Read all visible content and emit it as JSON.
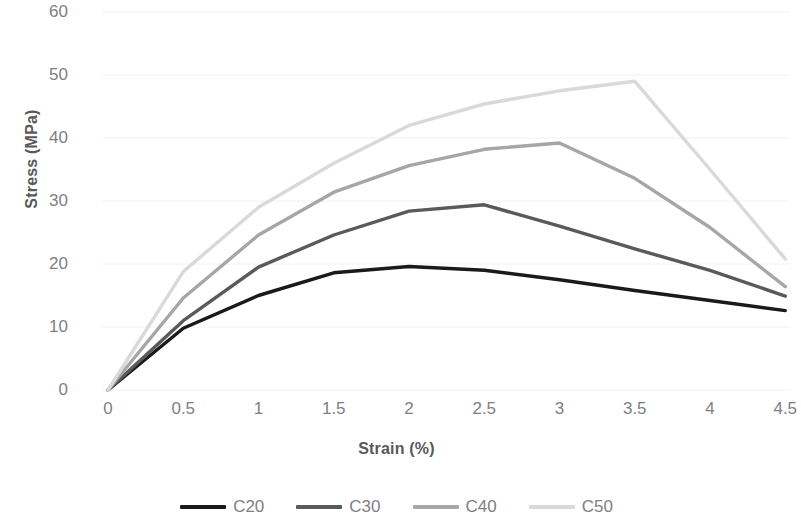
{
  "chart_data": {
    "type": "line",
    "title": "",
    "xlabel": "Strain (%)",
    "ylabel": "Stress (MPa)",
    "xlim": [
      0,
      4.75
    ],
    "ylim": [
      0,
      60
    ],
    "grid": true,
    "legend_position": "bottom",
    "x_ticks": [
      "0",
      "0.5",
      "1",
      "1.5",
      "2",
      "2.5",
      "3",
      "3.5",
      "4",
      "4.5"
    ],
    "x_tick_values": [
      0,
      0.5,
      1,
      1.5,
      2,
      2.5,
      3,
      3.5,
      4,
      4.5
    ],
    "y_ticks": [
      "0",
      "10",
      "20",
      "30",
      "40",
      "50",
      "60"
    ],
    "y_tick_values": [
      0,
      10,
      20,
      30,
      40,
      50,
      60
    ],
    "series": [
      {
        "name": "C20",
        "color": "#1a1a1a",
        "x": [
          0,
          0.5,
          1,
          1.5,
          2,
          2.5,
          3,
          3.5,
          4,
          4.5
        ],
        "values": [
          0,
          9.8,
          15.0,
          18.6,
          19.6,
          19.0,
          17.5,
          15.8,
          14.2,
          12.6
        ]
      },
      {
        "name": "C30",
        "color": "#5a5a5a",
        "x": [
          0,
          0.5,
          1,
          1.5,
          2,
          2.5,
          3,
          3.5,
          4,
          4.5
        ],
        "values": [
          0,
          11.0,
          19.5,
          24.6,
          28.4,
          29.4,
          26.0,
          22.4,
          19.0,
          14.9
        ]
      },
      {
        "name": "C40",
        "color": "#a6a6a6",
        "x": [
          0,
          0.5,
          1,
          1.5,
          2,
          2.5,
          3,
          3.5,
          4,
          4.5
        ],
        "values": [
          0,
          14.6,
          24.6,
          31.4,
          35.6,
          38.2,
          39.2,
          33.6,
          25.8,
          16.4
        ]
      },
      {
        "name": "C50",
        "color": "#d9d9d9",
        "x": [
          0,
          0.5,
          1,
          1.5,
          2,
          2.5,
          3,
          3.5,
          4,
          4.5
        ],
        "values": [
          0,
          18.8,
          29.0,
          36.0,
          42.0,
          45.4,
          47.5,
          49.0,
          35.0,
          20.8
        ]
      }
    ]
  },
  "legend": {
    "items": [
      {
        "label": "C20",
        "color": "#1a1a1a"
      },
      {
        "label": "C30",
        "color": "#5a5a5a"
      },
      {
        "label": "C40",
        "color": "#a6a6a6"
      },
      {
        "label": "C50",
        "color": "#d9d9d9"
      }
    ]
  },
  "colors": {
    "tick_text": "#808080",
    "axis_title": "#595959",
    "gridline": "#f2f2f2",
    "background": "#ffffff"
  }
}
